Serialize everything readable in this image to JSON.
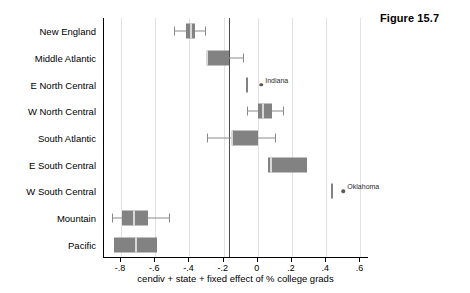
{
  "figure": {
    "caption": "Figure 15.7"
  },
  "chart_data": {
    "type": "box",
    "title": "",
    "xlabel": "cendiv + state + fixed effect of % college grads",
    "ylabel": "",
    "xlim": [
      -0.9,
      0.65
    ],
    "xticks": [
      -0.8,
      -0.6,
      -0.4,
      -0.2,
      0,
      0.2,
      0.4,
      0.6
    ],
    "xticklabels": [
      "-.8",
      "-.6",
      "-.4",
      "-.2",
      "0",
      ".2",
      ".4",
      ".6"
    ],
    "grid": "vertical",
    "reference_line": -0.17,
    "categories": [
      "New England",
      "Middle Atlantic",
      "E North Central",
      "W North Central",
      "South Atlantic",
      "E South Central",
      "W South Central",
      "Mountain",
      "Pacific"
    ],
    "boxes": [
      {
        "category": "New England",
        "whisker_low": -0.49,
        "q1": -0.42,
        "median": -0.39,
        "q3": -0.365,
        "whisker_high": -0.31,
        "outliers": []
      },
      {
        "category": "Middle Atlantic",
        "whisker_low": -0.3,
        "q1": -0.3,
        "median": -0.3,
        "q3": -0.17,
        "whisker_high": -0.087,
        "outliers": []
      },
      {
        "category": "E North Central",
        "whisker_low": -0.067,
        "q1": -0.067,
        "median": -0.064,
        "q3": -0.058,
        "whisker_high": -0.058,
        "outliers": [
          {
            "value": 0.02,
            "label": "Indiana"
          }
        ]
      },
      {
        "category": "W North Central",
        "whisker_low": -0.064,
        "q1": 0.0,
        "median": 0.029,
        "q3": 0.081,
        "whisker_high": 0.145,
        "outliers": []
      },
      {
        "category": "South Atlantic",
        "whisker_low": -0.3,
        "q1": -0.15,
        "median": -0.15,
        "q3": 0.0,
        "whisker_high": 0.1,
        "outliers": []
      },
      {
        "category": "E South Central",
        "whisker_low": 0.058,
        "q1": 0.058,
        "median": 0.075,
        "q3": 0.29,
        "whisker_high": 0.29,
        "outliers": []
      },
      {
        "category": "W South Central",
        "whisker_low": 0.425,
        "q1": 0.425,
        "median": 0.435,
        "q3": 0.44,
        "whisker_high": 0.44,
        "outliers": [
          {
            "value": 0.5,
            "label": "Oklahoma"
          }
        ]
      },
      {
        "category": "Mountain",
        "whisker_low": -0.852,
        "q1": -0.794,
        "median": -0.725,
        "q3": -0.644,
        "whisker_high": -0.52,
        "outliers": []
      },
      {
        "category": "Pacific",
        "whisker_low": -0.84,
        "q1": -0.84,
        "median": -0.71,
        "q3": -0.59,
        "whisker_high": -0.59,
        "outliers": []
      }
    ],
    "colors": {
      "box_fill": "#828282",
      "median": "#d9d9d9",
      "whisker": "#8a8a8a",
      "gridline": "#e2e2e2",
      "reference_line": "#4d4d4d",
      "outlier": "#5a5a5a",
      "axis": "#000000",
      "background": "#ffffff"
    }
  }
}
